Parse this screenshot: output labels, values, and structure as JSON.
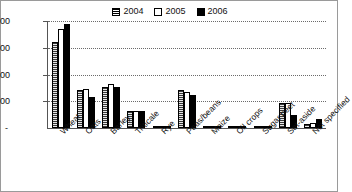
{
  "chart_data": {
    "type": "bar",
    "title": "",
    "xlabel": "",
    "ylabel": "",
    "ylim": [
      0,
      20000
    ],
    "grid": true,
    "legend_position": "top-center",
    "ytick_labels": [
      "20,000",
      "15,000",
      "10,000",
      "5,000",
      "-"
    ],
    "ytick_values": [
      20000,
      15000,
      10000,
      5000,
      0
    ],
    "categories": [
      "Wheat",
      "Oats",
      "Barley",
      "Triticale",
      "Rye",
      "Peas/beans",
      "Maize",
      "Oil crops",
      "Sugar beet",
      "Set-aside",
      "Not specified"
    ],
    "series": [
      {
        "name": "2004",
        "pattern": "striped",
        "values": [
          16100,
          7100,
          7600,
          3100,
          350,
          7100,
          420,
          130,
          180,
          4700,
          700
        ]
      },
      {
        "name": "2005",
        "pattern": "open",
        "values": [
          18600,
          7250,
          8300,
          3150,
          400,
          6700,
          300,
          150,
          420,
          4600,
          1000
        ]
      },
      {
        "name": "2006",
        "pattern": "solid",
        "values": [
          19500,
          5750,
          7600,
          3100,
          230,
          6100,
          200,
          300,
          80,
          2400,
          1700
        ]
      }
    ]
  },
  "legend": {
    "items": [
      {
        "label": "2004",
        "swatch": "striped"
      },
      {
        "label": "2005",
        "swatch": "open"
      },
      {
        "label": "2006",
        "swatch": "solid"
      }
    ]
  },
  "axis": {
    "y_labels": [
      "20,000",
      "15,000",
      "10,000",
      "5,000",
      "-"
    ]
  },
  "colors": {
    "series_2004": "#3a3a3a",
    "series_2005": "#ffffff",
    "series_2006": "#000000",
    "grid": "#6b6b6b",
    "axis": "#555555",
    "text": "#111111",
    "border": "#9a9a9a"
  }
}
